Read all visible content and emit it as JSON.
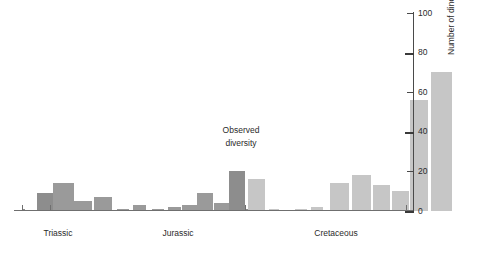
{
  "chart_data": {
    "type": "bar",
    "title": "",
    "subtitle": "",
    "xlabel": "",
    "ylabel": "Number of dinosaur genera",
    "ylim": [
      0,
      100
    ],
    "ytick_labels": [
      "0",
      "20",
      "40",
      "60",
      "80",
      "100"
    ],
    "ytick_values": [
      0,
      20,
      40,
      60,
      80,
      100
    ],
    "grid": false,
    "legend_position": "none",
    "annotations": [
      {
        "text_line1": "Observed",
        "text_line2": "diversity"
      }
    ],
    "categories": [
      "Triassic 1",
      "Triassic 2",
      "Triassic 3",
      "Triassic 4",
      "Triassic 5",
      "Triassic 6",
      "Jurassic 1",
      "Jurassic 2",
      "Jurassic 3",
      "Jurassic 4",
      "Jurassic 5",
      "Jurassic 6",
      "Jurassic 7",
      "Jurassic 8",
      "Jurassic 9",
      "Jurassic 10",
      "Cretaceous 1",
      "Cretaceous 2",
      "Cretaceous 3",
      "Cretaceous 4",
      "Cretaceous 5",
      "Cretaceous 6",
      "Cretaceous 7",
      "Cretaceous 8",
      "Cretaceous 9",
      "Cretaceous 10"
    ],
    "values": [
      1,
      9,
      1,
      14,
      5,
      7,
      1,
      3,
      1,
      2,
      3,
      9,
      4,
      20,
      1,
      16,
      1,
      1,
      2,
      14,
      18,
      13,
      10,
      56,
      70,
      1
    ],
    "series": [
      {
        "name": "Observed diversity",
        "values": [
          1,
          9,
          1,
          14,
          5,
          7,
          1,
          3,
          1,
          2,
          3,
          9,
          4,
          20,
          1,
          16,
          1,
          1,
          2,
          14,
          18,
          13,
          10,
          56,
          70,
          1
        ]
      }
    ],
    "bars": [
      {
        "value": 1,
        "x": 22,
        "w": 3,
        "tone": "dark"
      },
      {
        "value": 9,
        "x": 37,
        "w": 18,
        "tone": "dark"
      },
      {
        "value": 1,
        "x": 50,
        "w": 3,
        "tone": "dark"
      },
      {
        "value": 14,
        "x": 53,
        "w": 21,
        "tone": "mid"
      },
      {
        "value": 5,
        "x": 74,
        "w": 18,
        "tone": "mid"
      },
      {
        "value": 7,
        "x": 94,
        "w": 18,
        "tone": "mid"
      },
      {
        "value": 1,
        "x": 117,
        "w": 12,
        "tone": "mid"
      },
      {
        "value": 3,
        "x": 133,
        "w": 13,
        "tone": "mid"
      },
      {
        "value": 1,
        "x": 152,
        "w": 12,
        "tone": "mid"
      },
      {
        "value": 2,
        "x": 168,
        "w": 13,
        "tone": "mid"
      },
      {
        "value": 3,
        "x": 182,
        "w": 15,
        "tone": "mid"
      },
      {
        "value": 9,
        "x": 197,
        "w": 16,
        "tone": "mid"
      },
      {
        "value": 4,
        "x": 214,
        "w": 15,
        "tone": "mid"
      },
      {
        "value": 20,
        "x": 229,
        "w": 16,
        "tone": "dark"
      },
      {
        "value": 1,
        "x": 245,
        "w": 3,
        "tone": "dark"
      },
      {
        "value": 16,
        "x": 248,
        "w": 17,
        "tone": "light"
      },
      {
        "value": 1,
        "x": 269,
        "w": 10,
        "tone": "light"
      },
      {
        "value": 1,
        "x": 295,
        "w": 12,
        "tone": "light"
      },
      {
        "value": 2,
        "x": 311,
        "w": 12,
        "tone": "light"
      },
      {
        "value": 14,
        "x": 330,
        "w": 19,
        "tone": "light"
      },
      {
        "value": 18,
        "x": 352,
        "w": 19,
        "tone": "light"
      },
      {
        "value": 13,
        "x": 373,
        "w": 17,
        "tone": "light"
      },
      {
        "value": 10,
        "x": 392,
        "w": 17,
        "tone": "light"
      },
      {
        "value": 56,
        "x": 410,
        "w": 18,
        "tone": "light"
      },
      {
        "value": 70,
        "x": 431,
        "w": 21,
        "tone": "light"
      },
      {
        "value": 1,
        "x": 406,
        "w": 3,
        "tone": "light"
      }
    ]
  },
  "axis": {
    "y_label": "Number of dinosaur genera",
    "ticks": [
      {
        "label": "100",
        "value": 100
      },
      {
        "label": "80",
        "value": 80
      },
      {
        "label": "60",
        "value": 60
      },
      {
        "label": "40",
        "value": 40
      },
      {
        "label": "20",
        "value": 20
      },
      {
        "label": "0",
        "value": 0
      }
    ]
  },
  "periods": [
    {
      "label": "Triassic",
      "center_x": 58
    },
    {
      "label": "Jurassic",
      "center_x": 178
    },
    {
      "label": "Cretaceous",
      "center_x": 336
    }
  ],
  "annotation": {
    "line1": "Observed",
    "line2": "diversity"
  },
  "colors": {
    "bar_dark": "#8d8d8d",
    "bar_mid": "#9a9a9a",
    "bar_light": "#c6c6c6",
    "axis": "#4a4a4a",
    "text": "#2b2b2b",
    "background": "#ffffff"
  }
}
